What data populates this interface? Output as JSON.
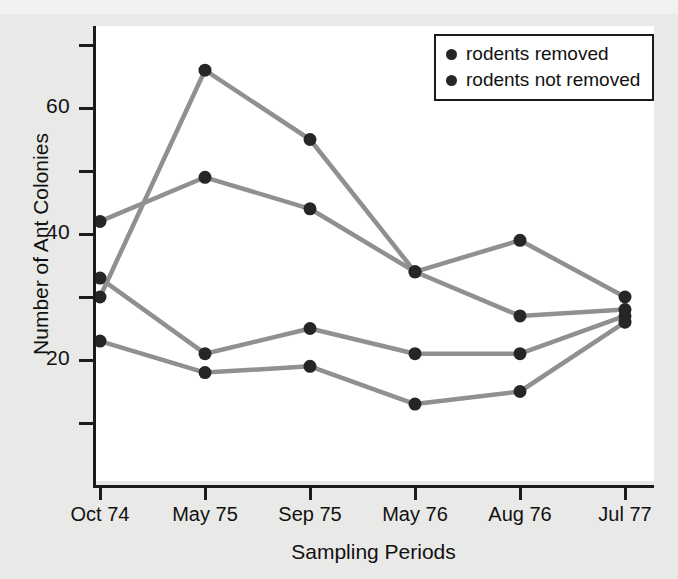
{
  "figure": {
    "background_color": "#e9e9e7",
    "plot_background_color": "#ffffff",
    "axis_color": "#1b1b1b",
    "line_color": "#909090",
    "marker_color": "#262626"
  },
  "axis": {
    "y_label": "Number of Ant Colonies",
    "x_label": "Sampling Periods",
    "y_tick_labels": [
      "20",
      "40",
      "60"
    ],
    "y_minor_ticks": [
      10,
      30,
      50,
      70
    ],
    "x_tick_labels": [
      "Oct 74",
      "May 75",
      "Sep 75",
      "May 76",
      "Aug 76",
      "Jul 77"
    ]
  },
  "legend": {
    "position": "top-right",
    "items": [
      {
        "label": "rodents removed",
        "color": "#262626",
        "marker": "filled-circle"
      },
      {
        "label": "rodents not removed",
        "color": "#262626",
        "marker": "filled-circle"
      }
    ]
  },
  "chart_data": {
    "type": "line",
    "title": "",
    "subtitle": "",
    "xlabel": "Sampling Periods",
    "ylabel": "Number of Ant Colonies",
    "categories": [
      "Oct 74",
      "May 75",
      "Sep 75",
      "May 76",
      "Aug 76",
      "Jul 77"
    ],
    "ylim": [
      0,
      72
    ],
    "yticks": [
      10,
      20,
      30,
      40,
      50,
      60,
      70
    ],
    "ytick_labels_shown": [
      20,
      40,
      60
    ],
    "grid": false,
    "legend_position": "top-right",
    "series": [
      {
        "name": "rodents removed (upper)",
        "group": "rodents removed",
        "values": [
          30,
          66,
          55,
          34,
          39,
          30
        ],
        "color": "#909090",
        "marker_color": "#262626"
      },
      {
        "name": "rodents removed (lower)",
        "group": "rodents removed",
        "values": [
          23,
          18,
          19,
          13,
          15,
          26
        ],
        "color": "#909090",
        "marker_color": "#262626"
      },
      {
        "name": "rodents not removed (upper)",
        "group": "rodents not removed",
        "values": [
          42,
          49,
          44,
          34,
          27,
          28
        ],
        "color": "#909090",
        "marker_color": "#262626"
      },
      {
        "name": "rodents not removed (lower)",
        "group": "rodents not removed",
        "values": [
          33,
          21,
          25,
          21,
          21,
          27
        ],
        "color": "#909090",
        "marker_color": "#262626"
      }
    ]
  }
}
